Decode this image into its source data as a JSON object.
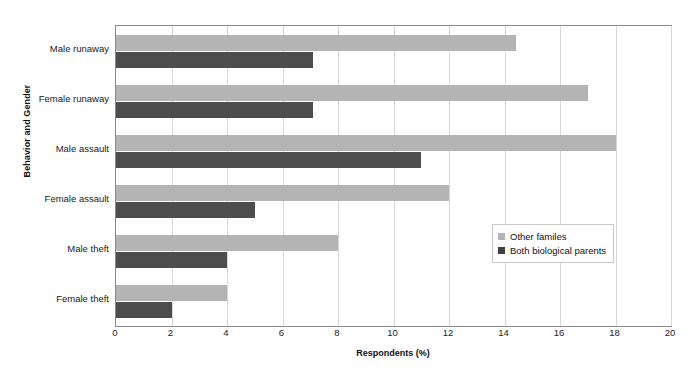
{
  "chart_data": {
    "type": "bar",
    "orientation": "horizontal",
    "title": "",
    "xlabel": "Respondents (%)",
    "ylabel": "Behavior and Gender",
    "xlim": [
      0,
      20
    ],
    "xticks": [
      0,
      2,
      4,
      6,
      8,
      10,
      12,
      14,
      16,
      18,
      20
    ],
    "xtick_labels": [
      "0",
      "2",
      "4",
      "6",
      "8",
      "10",
      "12",
      "14",
      "16",
      "18",
      "20"
    ],
    "grid": "vertical",
    "categories": [
      "Male runaway",
      "Female runaway",
      "Male assault",
      "Female assault",
      "Male theft",
      "Female theft"
    ],
    "series": [
      {
        "name": "Other familes",
        "color": "#b4b4b4",
        "values": [
          14.4,
          17.0,
          18.0,
          12.0,
          8.0,
          4.0
        ]
      },
      {
        "name": "Both biological parents",
        "color": "#4d4d4d",
        "values": [
          7.1,
          7.1,
          11.0,
          5.0,
          4.0,
          2.0
        ]
      }
    ],
    "legend": {
      "position": "center-right",
      "entries": [
        {
          "label": "Other familes",
          "swatch": "#b4b4b4"
        },
        {
          "label": "Both biological parents",
          "swatch": "#3f3f3f"
        }
      ]
    }
  }
}
